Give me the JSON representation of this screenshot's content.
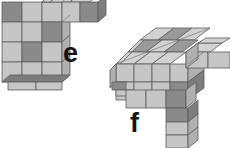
{
  "figure": {
    "background_color": "#ffffff",
    "outline_color": "#555555",
    "palette": {
      "top_light": "#d2d2d2",
      "top_dark": "#9a9a9a",
      "front_light": "#c6c6c6",
      "front_dark": "#8a8a8a",
      "side_light": "#b0b0b0",
      "side_dark": "#7d7d7d",
      "edge": "#5a5a5a"
    }
  },
  "labels": [
    {
      "id": "e",
      "text": "e",
      "x": 63,
      "y": 40
    },
    {
      "id": "f",
      "text": "f",
      "x": 130,
      "y": 110
    }
  ],
  "shapes": [
    {
      "id": "e",
      "name": "polycube-e",
      "label": "e",
      "description": "Front-facing 3x4 checkered slab with a one-cube arm protruding to the upper right",
      "front_grid": {
        "columns": 3,
        "rows": 4,
        "cell_px": 20,
        "origin": [
          2,
          2
        ],
        "shading": [
          [
            "dark",
            "light",
            "light"
          ],
          [
            "light",
            "light",
            "dark"
          ],
          [
            "light",
            "dark",
            "light"
          ],
          [
            "light",
            "light",
            "light"
          ]
        ]
      },
      "arm": {
        "direction": "right",
        "cubes": 2,
        "shading": [
          "light",
          "dark"
        ]
      }
    },
    {
      "id": "f",
      "name": "polycube-f",
      "label": "f",
      "description": "Isometric 3x3 checkered top slab with a two-cube arm to the right and a three-cube leg dropping down in front",
      "top_grid": {
        "columns": 3,
        "rows": 3,
        "shading": [
          [
            "light",
            "dark",
            "light"
          ],
          [
            "dark",
            "light",
            "dark"
          ],
          [
            "light",
            "light",
            "light"
          ]
        ]
      },
      "front_grid": {
        "columns": 4,
        "rows": 2,
        "shading": [
          [
            "light",
            "light",
            "light",
            "light"
          ],
          [
            "light",
            "light",
            "light",
            "dark"
          ]
        ]
      },
      "arm": {
        "direction": "right",
        "cubes": 2,
        "shading": [
          "light",
          "light"
        ]
      },
      "leg": {
        "direction": "down",
        "cubes": 3,
        "shading": [
          "dark",
          "light",
          "light"
        ]
      }
    }
  ]
}
